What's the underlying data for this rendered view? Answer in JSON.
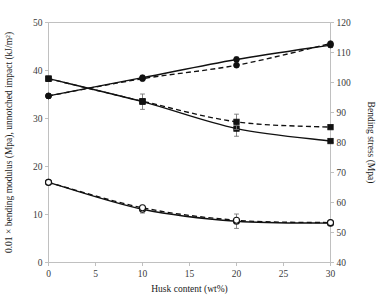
{
  "figure": {
    "background": "#ffffff",
    "ink_color": "#111111",
    "axis_color": "#b9b9b9",
    "errorbar_color": "#767676"
  },
  "chart_data": {
    "type": "line",
    "title": "",
    "subtitle": "",
    "xlabel": "Husk content (wt%)",
    "ylabel": "0.01 × bending modulus (Mpa), unnotched impact (kJ/m²)",
    "y2label": "Bending stress (Mpa)",
    "x": [
      0,
      10,
      20,
      30
    ],
    "xlim": [
      0,
      30
    ],
    "ylim": [
      0,
      50
    ],
    "y2lim": [
      40,
      120
    ],
    "xticks": [
      0,
      5,
      10,
      15,
      20,
      25,
      30
    ],
    "xticklabels": [
      "0",
      "5",
      "10",
      "15",
      "20",
      "25",
      "30"
    ],
    "yticks": [
      0,
      10,
      20,
      30,
      40,
      50
    ],
    "yticklabels": [
      "0",
      "10",
      "20",
      "30",
      "40",
      "50"
    ],
    "y2ticks": [
      40,
      50,
      60,
      70,
      80,
      90,
      100,
      110,
      120
    ],
    "y2ticklabels": [
      "40",
      "50",
      "60",
      "70",
      "80",
      "90",
      "100",
      "110",
      "120"
    ],
    "grid": false,
    "legend": "none",
    "series": [
      {
        "name": "bending-stress-solid",
        "axis": "left",
        "style": "solid",
        "marker": "filled-circle",
        "values": [
          34.7,
          38.5,
          42.3,
          45.3
        ],
        "errors": [
          0.0,
          0.5,
          0.5,
          0.5
        ]
      },
      {
        "name": "bending-stress-dashed",
        "axis": "left",
        "style": "dashed",
        "marker": "filled-circle",
        "values": [
          34.7,
          38.3,
          41.1,
          45.6
        ],
        "errors": [
          0.0,
          0.0,
          0.0,
          0.0
        ]
      },
      {
        "name": "bending-modulus-solid",
        "axis": "left",
        "style": "solid",
        "marker": "filled-square",
        "values": [
          38.3,
          33.5,
          27.9,
          25.3
        ],
        "errors": [
          0.0,
          1.6,
          1.6,
          0.0
        ]
      },
      {
        "name": "bending-modulus-dashed",
        "axis": "left",
        "style": "dashed",
        "marker": "filled-square",
        "values": [
          38.3,
          33.6,
          29.3,
          28.2
        ],
        "errors": [
          0.0,
          0.0,
          1.6,
          0.0
        ]
      },
      {
        "name": "unnotched-impact-solid",
        "axis": "left",
        "style": "solid",
        "marker": "open-circle",
        "values": [
          16.7,
          11.1,
          8.6,
          8.2
        ],
        "errors": [
          0.0,
          0.8,
          1.5,
          0.0
        ]
      },
      {
        "name": "unnotched-impact-dashed",
        "axis": "left",
        "style": "dashed",
        "marker": "open-circle",
        "values": [
          16.7,
          11.4,
          8.8,
          8.3
        ],
        "errors": [
          0.0,
          0.0,
          0.0,
          0.0
        ]
      }
    ]
  }
}
